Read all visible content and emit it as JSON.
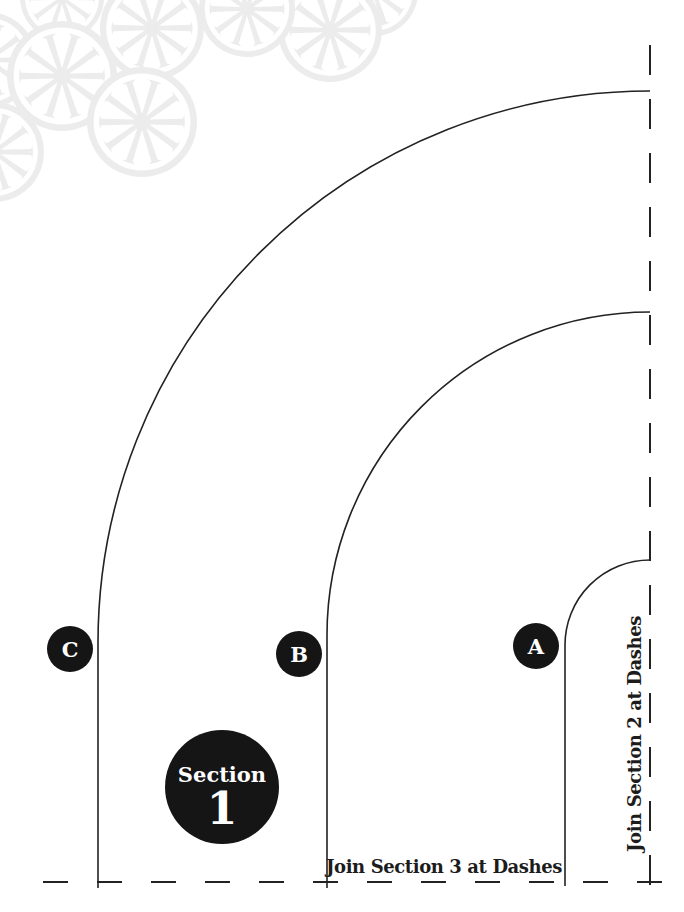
{
  "sheet": {
    "section_badge": {
      "word": "Section",
      "number": "1"
    },
    "cut_lines": [
      {
        "label": "C"
      },
      {
        "label": "B"
      },
      {
        "label": "A"
      }
    ],
    "join_note_bottom": "Join Section 3 at Dashes",
    "join_note_right": "Join Section 2 at Dashes"
  },
  "decor": {
    "icon": "pinwheel-flower-icon",
    "color": "#ececec"
  },
  "colors": {
    "line": "#222222",
    "badge_fill": "#151515",
    "badge_text": "#ffffff",
    "paper": "#ffffff"
  }
}
